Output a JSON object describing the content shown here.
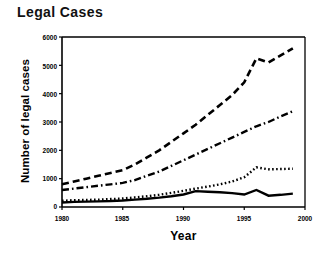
{
  "chart_data": {
    "type": "line",
    "title": "Legal Cases",
    "xlabel": "Year",
    "ylabel": "Number of legal cases",
    "xlim": [
      1980,
      2000
    ],
    "ylim": [
      0,
      6000
    ],
    "xticks": [
      "1980",
      "1985",
      "1990",
      "1995",
      "2000"
    ],
    "yticks": [
      "0",
      "1000",
      "2000",
      "3000",
      "4000",
      "5000",
      "6000"
    ],
    "grid": false,
    "legend": "none",
    "x": [
      1980,
      1981,
      1982,
      1983,
      1984,
      1985,
      1986,
      1987,
      1988,
      1989,
      1990,
      1991,
      1992,
      1993,
      1994,
      1995,
      1996,
      1997,
      1998,
      1999
    ],
    "series": [
      {
        "name": "series-dashed",
        "style": "dashed",
        "values": [
          800,
          900,
          1000,
          1100,
          1200,
          1300,
          1500,
          1750,
          2000,
          2300,
          2600,
          2900,
          3250,
          3600,
          3950,
          4400,
          5250,
          5100,
          5350,
          5600
        ]
      },
      {
        "name": "series-dash-dot",
        "style": "dash-dot",
        "values": [
          600,
          650,
          700,
          750,
          800,
          850,
          950,
          1100,
          1250,
          1450,
          1650,
          1850,
          2050,
          2250,
          2450,
          2650,
          2850,
          3000,
          3200,
          3380
        ]
      },
      {
        "name": "series-dotted",
        "style": "dotted",
        "values": [
          220,
          240,
          250,
          260,
          280,
          300,
          340,
          380,
          430,
          500,
          570,
          650,
          720,
          800,
          900,
          1050,
          1400,
          1330,
          1340,
          1350
        ]
      },
      {
        "name": "series-solid",
        "style": "solid",
        "values": [
          160,
          180,
          190,
          200,
          210,
          230,
          260,
          290,
          330,
          380,
          440,
          560,
          540,
          520,
          490,
          440,
          600,
          400,
          430,
          470
        ]
      }
    ]
  }
}
